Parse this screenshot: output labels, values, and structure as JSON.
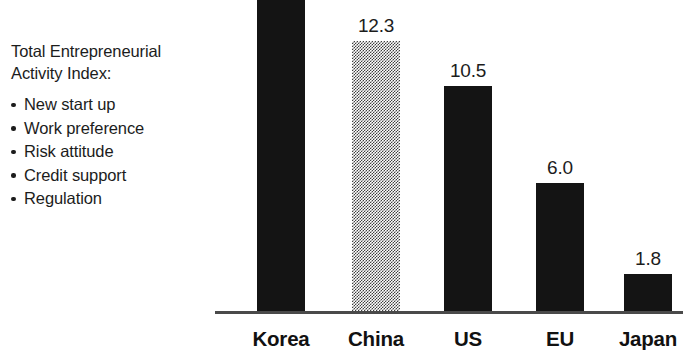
{
  "caption": {
    "title": "Total Entrepreneurial\nActivity Index:",
    "bullets": [
      "New start up",
      "Work preference",
      "Risk attitude",
      "Credit support",
      "Regulation"
    ]
  },
  "chart_data": {
    "type": "bar",
    "title": "Total Entrepreneurial Activity Index:",
    "xlabel": "",
    "ylabel": "",
    "categories": [
      "Korea",
      "China",
      "US",
      "EU",
      "Japan"
    ],
    "values": [
      null,
      12.3,
      10.5,
      6.0,
      1.8
    ],
    "value_labels": [
      "",
      "12.3",
      "10.5",
      "6.0",
      "1.8"
    ],
    "bar_fills": [
      "solid-black",
      "checkered-gray",
      "solid-black",
      "solid-black",
      "solid-black"
    ],
    "grid": false,
    "legend": "none",
    "axis_color": "#4a4a4a",
    "bar_color": "#141414",
    "bar_color_alt": "#3f3f3f",
    "ylim": [
      0,
      14.5
    ],
    "bars": [
      {
        "category": "Korea",
        "label": "",
        "left": 257,
        "top": 0,
        "clipped": true
      },
      {
        "category": "China",
        "label": "12.3",
        "left": 352,
        "top": 41,
        "clipped": false
      },
      {
        "category": "US",
        "label": "10.5",
        "left": 444,
        "top": 86,
        "clipped": false
      },
      {
        "category": "EU",
        "label": "6.0",
        "left": 536,
        "top": 183,
        "clipped": false
      },
      {
        "category": "Japan",
        "label": "1.8",
        "left": 624,
        "top": 274,
        "clipped": false
      }
    ]
  }
}
